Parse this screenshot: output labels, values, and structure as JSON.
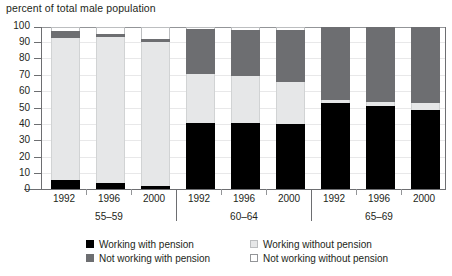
{
  "chart_data": {
    "type": "bar",
    "subtype": "stacked-100-percent-grouped",
    "title": "",
    "ylabel": "percent of total male population",
    "xlabel": "",
    "ylim": [
      0,
      100
    ],
    "yticks": [
      0,
      10,
      20,
      30,
      40,
      50,
      60,
      70,
      80,
      90,
      100
    ],
    "grid": true,
    "legend_position": "bottom",
    "categories": [
      "1992",
      "1996",
      "2000",
      "1992",
      "1996",
      "2000",
      "1992",
      "1996",
      "2000"
    ],
    "groups": [
      {
        "label": "55–59",
        "years": [
          "1992",
          "1996",
          "2000"
        ]
      },
      {
        "label": "60–64",
        "years": [
          "1992",
          "1996",
          "2000"
        ]
      },
      {
        "label": "65–69",
        "years": [
          "1992",
          "1996",
          "2000"
        ]
      }
    ],
    "series": [
      {
        "name": "Working with pension",
        "key": "wwp",
        "color": "#000000",
        "values": [
          5.5,
          4.0,
          2.0,
          41.0,
          41.0,
          40.0,
          53.0,
          51.0,
          49.0
        ]
      },
      {
        "name": "Working without pension",
        "key": "wwo",
        "color": "#e6e7e8",
        "values": [
          88.0,
          90.0,
          89.0,
          30.0,
          29.0,
          26.0,
          2.0,
          3.0,
          4.0
        ]
      },
      {
        "name": "Not working with pension",
        "key": "nwwp",
        "color": "#6d6e71",
        "values": [
          4.0,
          2.0,
          1.5,
          28.0,
          28.0,
          32.0,
          45.0,
          46.0,
          47.0
        ]
      },
      {
        "name": "Not working without pension",
        "key": "nwwo",
        "color": "#ffffff",
        "values": [
          2.5,
          4.0,
          7.5,
          1.0,
          2.0,
          2.0,
          0.0,
          0.0,
          0.0
        ]
      }
    ]
  },
  "axis": {
    "title": "percent of total male population",
    "y_labels": [
      "100",
      "90",
      "80",
      "70",
      "60",
      "50",
      "40",
      "30",
      "20",
      "10",
      "0"
    ],
    "x_labels": [
      "1992",
      "1996",
      "2000",
      "1992",
      "1996",
      "2000",
      "1992",
      "1996",
      "2000"
    ],
    "group_labels": [
      "55–59",
      "60–64",
      "65–69"
    ]
  },
  "legend": {
    "items": [
      {
        "label": "Working with pension",
        "swatch": "black-swatch"
      },
      {
        "label": "Working without pension",
        "swatch": "light-gray-swatch"
      },
      {
        "label": "Not working with pension",
        "swatch": "dark-gray-swatch"
      },
      {
        "label": "Not working without pension",
        "swatch": "white-swatch"
      }
    ]
  }
}
